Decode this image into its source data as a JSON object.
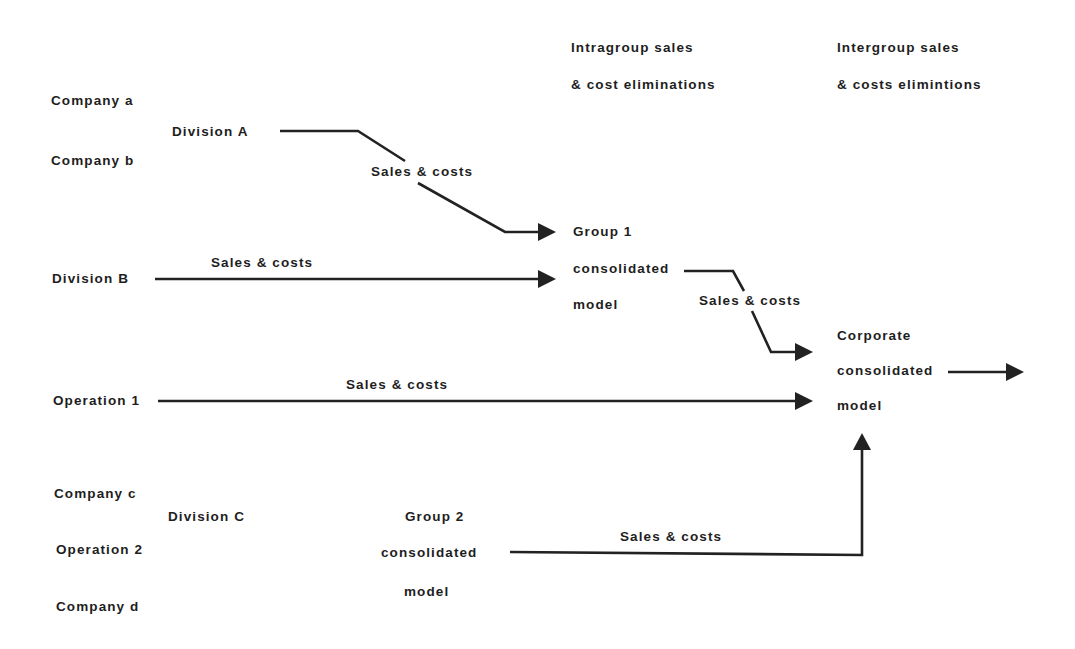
{
  "headers": {
    "intragroup": {
      "line1": "Intragroup sales",
      "line2": "& cost eliminations"
    },
    "intergroup": {
      "line1": "Intergroup sales",
      "line2": "& costs elimintions"
    }
  },
  "entities": {
    "company_a": "Company a",
    "company_b": "Company b",
    "division_a": "Division A",
    "division_b": "Division B",
    "operation_1": "Operation 1",
    "company_c": "Company c",
    "division_c": "Division C",
    "operation_2": "Operation 2",
    "company_d": "Company d"
  },
  "models": {
    "group1": {
      "line1": "Group 1",
      "line2": "consolidated",
      "line3": "model"
    },
    "group2": {
      "line1": "Group 2",
      "line2": "consolidated",
      "line3": "model"
    },
    "corporate": {
      "line1": "Corporate",
      "line2": "consolidated",
      "line3": "model"
    }
  },
  "flows": {
    "division_a_to_group1": "Sales & costs",
    "division_b_to_group1": "Sales & costs",
    "group1_to_corporate": "Sales & costs",
    "operation1_to_corporate": "Sales & costs",
    "group2_to_corporate": "Sales & costs"
  },
  "colors": {
    "ink": "#222222",
    "background": "#ffffff"
  }
}
